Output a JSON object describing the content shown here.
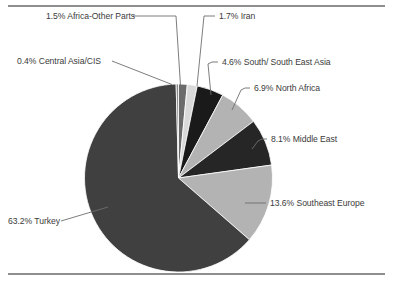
{
  "figure": {
    "has_top_rule": true,
    "has_bottom_rule": true,
    "background_color": "#ffffff"
  },
  "chart_data": {
    "type": "pie",
    "title": "",
    "subtitle": "",
    "xlabel": "",
    "ylabel": "",
    "legend_position": "none",
    "grid": false,
    "units": "percent",
    "total": 100.0,
    "start_angle_deg": 0,
    "direction": "clockwise",
    "categories": [
      "Africa-Other Parts",
      "Iran",
      "South/ South East Asia",
      "North Africa",
      "Middle East",
      "Southeast Europe",
      "Turkey",
      "Central Asia/CIS"
    ],
    "values": [
      1.5,
      1.7,
      4.6,
      6.9,
      8.1,
      13.6,
      63.2,
      0.4
    ],
    "slice_colors": [
      "#6b6b6b",
      "#d9d9d9",
      "#1a1a1a",
      "#b3b3b3",
      "#262626",
      "#b3b3b3",
      "#404040",
      "#8a8a8a"
    ],
    "slices": [
      {
        "label": "1.5% Africa-Other Parts",
        "name": "Africa-Other Parts",
        "value": 1.5,
        "color": "#6b6b6b"
      },
      {
        "label": "1.7% Iran",
        "name": "Iran",
        "value": 1.7,
        "color": "#d9d9d9"
      },
      {
        "label": "4.6% South/ South East Asia",
        "name": "South/ South East Asia",
        "value": 4.6,
        "color": "#1a1a1a"
      },
      {
        "label": "6.9% North Africa",
        "name": "North Africa",
        "value": 6.9,
        "color": "#b3b3b3"
      },
      {
        "label": "8.1% Middle East",
        "name": "Middle East",
        "value": 8.1,
        "color": "#262626"
      },
      {
        "label": "13.6% Southeast Europe",
        "name": "Southeast Europe",
        "value": 13.6,
        "color": "#b3b3b3"
      },
      {
        "label": "63.2% Turkey",
        "name": "Turkey",
        "value": 63.2,
        "color": "#404040"
      },
      {
        "label": "0.4% Central Asia/CIS",
        "name": "Central Asia/CIS",
        "value": 0.4,
        "color": "#8a8a8a"
      }
    ]
  },
  "labels": {
    "africa_other": "1.5% Africa-Other Parts",
    "iran": "1.7% Iran",
    "central_asia": "0.4% Central Asia/CIS",
    "south_asia": "4.6% South/ South East Asia",
    "north_africa": "6.9% North Africa",
    "middle_east": "8.1% Middle East",
    "southeast_europe": "13.6% Southeast Europe",
    "turkey": "63.2% Turkey"
  }
}
